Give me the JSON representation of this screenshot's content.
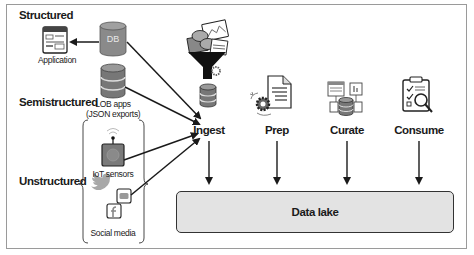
{
  "categories": {
    "structured": "Structured",
    "semistructured": "Semistructured",
    "unstructured": "Unstructured"
  },
  "sources": {
    "application": "Application",
    "db": "DB",
    "lob_apps_line1": "LOB apps",
    "lob_apps_line2": "(JSON exports)",
    "iot": "IoT sensors",
    "social": "Social media"
  },
  "stages": [
    {
      "label": "Ingest",
      "icon": "funnel-icon"
    },
    {
      "label": "Prep",
      "icon": "document-gear-icon"
    },
    {
      "label": "Curate",
      "icon": "curate-database-icon"
    },
    {
      "label": "Consume",
      "icon": "clipboard-magnifier-icon"
    }
  ],
  "destination": {
    "label": "Data lake"
  },
  "colors": {
    "stroke": "#1a1a1a",
    "db_fill": "#8a8a8a",
    "lake_fill": "#e3e3e3",
    "frame": "#9a9a9a"
  }
}
